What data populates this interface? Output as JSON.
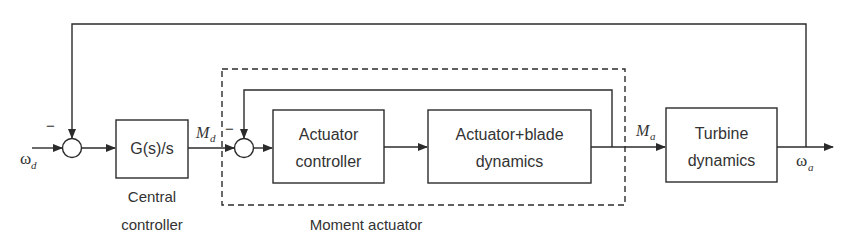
{
  "diagram": {
    "type": "block-diagram",
    "signals": {
      "input": {
        "symbol": "ω",
        "subscript": "d"
      },
      "setpoint_moment": {
        "symbol": "M",
        "subscript": "d"
      },
      "actual_moment": {
        "symbol": "M",
        "subscript": "a"
      },
      "output": {
        "symbol": "ω",
        "subscript": "a"
      }
    },
    "summing_junctions": [
      {
        "id": "sum1",
        "feedback_sign": "−"
      },
      {
        "id": "sum2",
        "feedback_sign": "−"
      }
    ],
    "blocks": {
      "central": {
        "line1": "G(s)/s"
      },
      "actuator_controller": {
        "line1": "Actuator",
        "line2": "controller"
      },
      "actuator_blade": {
        "line1": "Actuator+blade",
        "line2": "dynamics"
      },
      "turbine": {
        "line1": "Turbine",
        "line2": "dynamics"
      }
    },
    "captions": {
      "central_line1": "Central",
      "central_line2": "controller",
      "moment_actuator": "Moment actuator"
    },
    "colors": {
      "stroke": "#2b2b2b",
      "text": "#333333",
      "background": "#ffffff"
    }
  }
}
